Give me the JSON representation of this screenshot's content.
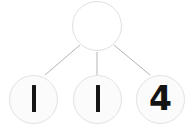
{
  "diagram": {
    "type": "number-bond-tree",
    "background_color": "#ffffff",
    "node_fill_color": "#fbfbfb",
    "node_border_color": "#e0e0e0",
    "edge_color": "#b0b0b0",
    "digit_color": "#141414",
    "parent": {
      "label": "",
      "value": null,
      "state": "empty"
    },
    "children": [
      {
        "label": "1",
        "glyph": "vertical-stroke"
      },
      {
        "label": "1",
        "glyph": "vertical-stroke"
      },
      {
        "label": "4",
        "glyph": "digit"
      }
    ],
    "edges": [
      {
        "from": "parent",
        "to": "child-1"
      },
      {
        "from": "parent",
        "to": "child-2"
      },
      {
        "from": "parent",
        "to": "child-3"
      }
    ]
  }
}
